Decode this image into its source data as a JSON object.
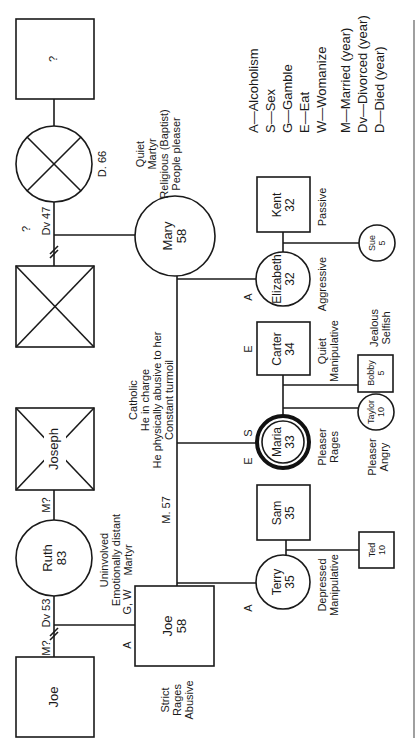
{
  "legend": {
    "addictions": [
      "A—Alcoholism",
      "S—Sex",
      "G—Gamble",
      "E—Eat",
      "W—Womanize"
    ],
    "events": [
      "M—Married (year)",
      "Dv—Divorced (year)",
      "D—Died (year)"
    ]
  },
  "people": {
    "unknown_father": {
      "name": "?",
      "symbol": "male"
    },
    "mary_mother": {
      "name": "",
      "symbol": "female-deceased",
      "note": "D. 66"
    },
    "mary_father": {
      "name": "",
      "symbol": "male-deceased"
    },
    "joseph": {
      "name": "Joseph",
      "symbol": "male-deceased"
    },
    "ruth": {
      "name": "Ruth",
      "age": "83",
      "symbol": "female",
      "traits": [
        "Uninvolved",
        "Emotionally distant",
        "Martyr"
      ]
    },
    "joe_sr": {
      "name": "Joe",
      "symbol": "male"
    },
    "mary": {
      "name": "Mary",
      "age": "58",
      "symbol": "female",
      "traits": [
        "Quiet",
        "Martyr",
        "Religious (Baptist)",
        "People pleaser"
      ]
    },
    "joe": {
      "name": "Joe",
      "age": "58",
      "symbol": "male",
      "addiction_left": "A",
      "addiction_top": "G, W",
      "traits": [
        "Strict",
        "Rages",
        "Abusive"
      ]
    },
    "kent": {
      "name": "Kent",
      "age": "32",
      "symbol": "male",
      "traits": [
        "Passive"
      ]
    },
    "elizabeth": {
      "name": "Elizabeth",
      "age": "32",
      "symbol": "female",
      "addiction": "A",
      "traits": [
        "Aggressive"
      ]
    },
    "sue": {
      "name": "Sue",
      "age": "5",
      "symbol": "female"
    },
    "carter": {
      "name": "Carter",
      "age": "34",
      "symbol": "male",
      "addiction": "E",
      "traits": [
        "Quiet",
        "Manipulative"
      ]
    },
    "maria": {
      "name": "Maria",
      "age": "33",
      "symbol": "female-index",
      "addiction_s": "S",
      "addiction_e": "E",
      "traits": [
        "Pleaser",
        "Rages"
      ]
    },
    "bobby": {
      "name": "Bobby",
      "age": "5",
      "symbol": "male",
      "traits": [
        "Jealous",
        "Selfish"
      ]
    },
    "taylor": {
      "name": "Taylor",
      "age": "10",
      "symbol": "female",
      "traits": [
        "Pleaser",
        "Angry"
      ]
    },
    "sam": {
      "name": "Sam",
      "age": "35",
      "symbol": "male"
    },
    "terry": {
      "name": "Terry",
      "age": "35",
      "symbol": "female",
      "addiction": "A",
      "traits": [
        "Depressed",
        "Manipulative"
      ]
    },
    "ted": {
      "name": "Ted",
      "age": "10",
      "symbol": "male"
    }
  },
  "relationships": {
    "mary_parents_status": "Dv 47",
    "mary_parents_marriage": "?",
    "joe_parents_divorce": "Dv 53",
    "joe_parents_marriage": "M?",
    "ruth_joseph_marriage": "M?",
    "joe_mary_marriage": "M. 57",
    "joe_mary_traits": [
      "Catholic",
      "He in charge",
      "He physically abusive to her",
      "Constant turmoil"
    ]
  }
}
